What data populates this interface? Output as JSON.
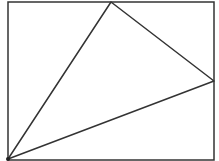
{
  "diagram": {
    "type": "geometry",
    "stroke_color": "#333333",
    "background": "#ffffff",
    "rectangle": {
      "x": 8,
      "y": 2,
      "width": 206,
      "height": 158
    },
    "triangle": {
      "vertices": [
        {
          "name": "bottom-left",
          "x": 8,
          "y": 159
        },
        {
          "name": "top",
          "x": 111,
          "y": 2
        },
        {
          "name": "right",
          "x": 214,
          "y": 81
        }
      ]
    },
    "labels": []
  }
}
